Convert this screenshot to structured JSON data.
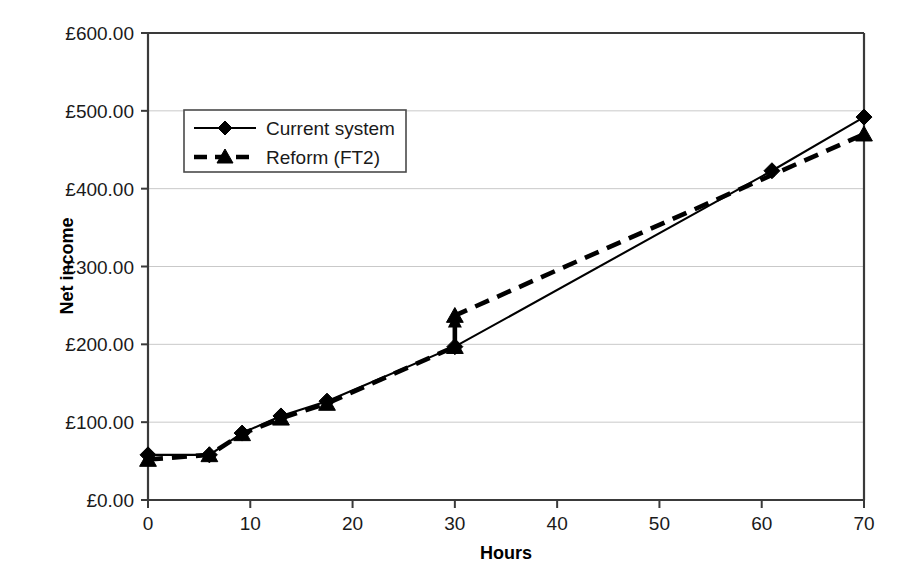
{
  "chart_data": {
    "type": "line",
    "title": "",
    "xlabel": "Hours",
    "ylabel": "Net income",
    "xlim": [
      0,
      70
    ],
    "ylim": [
      0,
      600
    ],
    "grid": true,
    "legend_position": "upper-left-inside",
    "x_ticks": [
      "0",
      "10",
      "20",
      "30",
      "40",
      "50",
      "60",
      "70"
    ],
    "x_tick_values": [
      0,
      10,
      20,
      30,
      40,
      50,
      60,
      70
    ],
    "y_ticks": [
      "£0.00",
      "£100.00",
      "£200.00",
      "£300.00",
      "£400.00",
      "£500.00",
      "£600.00"
    ],
    "y_tick_values": [
      0,
      100,
      200,
      300,
      400,
      500,
      600
    ],
    "currency_symbol": "£",
    "series": [
      {
        "name": "Current system",
        "marker": "diamond",
        "linestyle": "solid",
        "color": "#000000",
        "points": [
          {
            "x": 0,
            "y": 58
          },
          {
            "x": 6,
            "y": 58
          },
          {
            "x": 9.2,
            "y": 86
          },
          {
            "x": 13,
            "y": 108
          },
          {
            "x": 17.5,
            "y": 127
          },
          {
            "x": 30,
            "y": 197
          },
          {
            "x": 61,
            "y": 423
          },
          {
            "x": 70,
            "y": 492
          }
        ]
      },
      {
        "name": "Reform (FT2)",
        "marker": "triangle",
        "linestyle": "dashed",
        "color": "#000000",
        "points": [
          {
            "x": 0,
            "y": 52
          },
          {
            "x": 6,
            "y": 58
          },
          {
            "x": 9.2,
            "y": 85
          },
          {
            "x": 13,
            "y": 105
          },
          {
            "x": 17.5,
            "y": 124
          },
          {
            "x": 30,
            "y": 197
          },
          {
            "x": 30,
            "y": 237
          },
          {
            "x": 70,
            "y": 470
          }
        ],
        "annotation": {
          "type": "vertical-jump-arrow",
          "x": 30,
          "y_from": 197,
          "y_to": 237
        }
      }
    ]
  },
  "legend": {
    "entries": [
      {
        "label": "Current system",
        "marker": "diamond-marker",
        "style": "solid"
      },
      {
        "label": "Reform (FT2)",
        "marker": "triangle-marker",
        "style": "dashed"
      }
    ]
  },
  "colors": {
    "series": "#000000",
    "gridline": "#c9c9c9",
    "axis": "#3a3a3a",
    "background": "#ffffff"
  }
}
